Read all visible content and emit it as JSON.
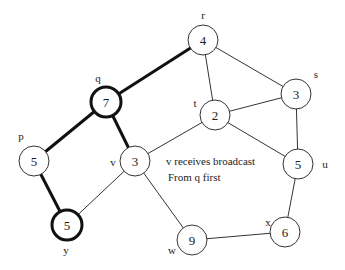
{
  "diagram": {
    "title": "",
    "annotation": {
      "line1": "v receives broadcast",
      "line2": "From q first"
    },
    "nodes": [
      {
        "id": "r",
        "label": "r",
        "value": "4",
        "bold": false
      },
      {
        "id": "q",
        "label": "q",
        "value": "7",
        "bold": true
      },
      {
        "id": "s",
        "label": "s",
        "value": "3",
        "bold": false
      },
      {
        "id": "t",
        "label": "t",
        "value": "2",
        "bold": false
      },
      {
        "id": "p",
        "label": "p",
        "value": "5",
        "bold": false
      },
      {
        "id": "v",
        "label": "v",
        "value": "3",
        "bold": false
      },
      {
        "id": "u",
        "label": "u",
        "value": "5",
        "bold": false
      },
      {
        "id": "y",
        "label": "y",
        "value": "5",
        "bold": true
      },
      {
        "id": "x",
        "label": "x",
        "value": "6",
        "bold": false
      },
      {
        "id": "w",
        "label": "w",
        "value": "9",
        "bold": false
      }
    ],
    "edges": [
      {
        "from": "q",
        "to": "r",
        "bold": true
      },
      {
        "from": "q",
        "to": "p",
        "bold": true
      },
      {
        "from": "q",
        "to": "v",
        "bold": true
      },
      {
        "from": "p",
        "to": "y",
        "bold": true
      },
      {
        "from": "r",
        "to": "t",
        "bold": false
      },
      {
        "from": "r",
        "to": "s",
        "bold": false
      },
      {
        "from": "t",
        "to": "s",
        "bold": false
      },
      {
        "from": "t",
        "to": "v",
        "bold": false
      },
      {
        "from": "t",
        "to": "u",
        "bold": false
      },
      {
        "from": "s",
        "to": "u",
        "bold": false
      },
      {
        "from": "v",
        "to": "y",
        "bold": false
      },
      {
        "from": "v",
        "to": "w",
        "bold": false
      },
      {
        "from": "u",
        "to": "x",
        "bold": false
      },
      {
        "from": "x",
        "to": "w",
        "bold": false
      }
    ]
  }
}
